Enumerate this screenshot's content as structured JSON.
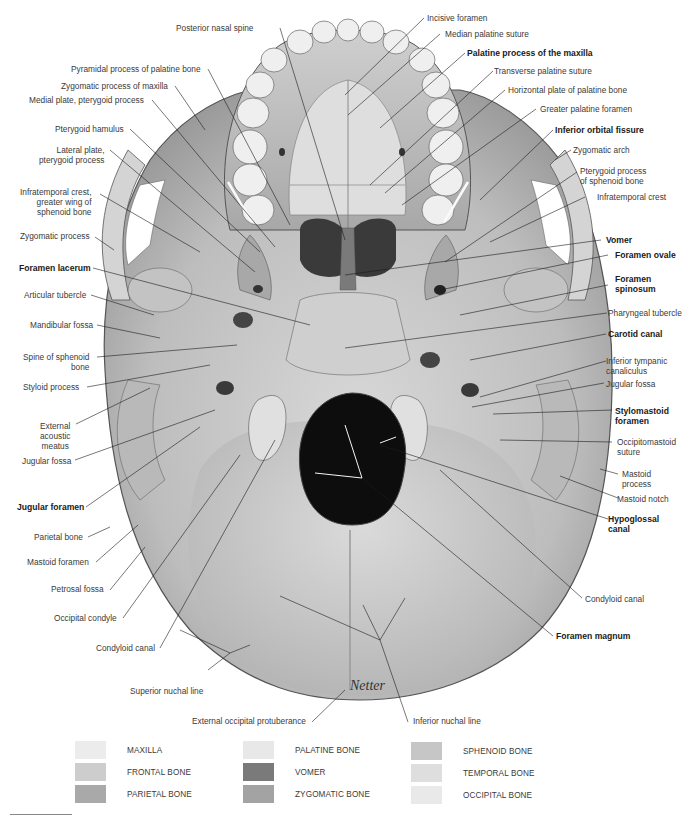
{
  "figure": {
    "signature": "Netter",
    "labels_left": [
      {
        "id": "posterior-nasal-spine",
        "text": "Posterior nasal spine",
        "bold": false
      },
      {
        "id": "pyramidal-process",
        "text": "Pyramidal process of palatine bone",
        "bold": false
      },
      {
        "id": "zygomatic-process-maxilla",
        "text": "Zygomatic process of maxilla",
        "bold": false
      },
      {
        "id": "medial-plate",
        "text": "Medial plate, pterygoid process",
        "bold": false
      },
      {
        "id": "pterygoid-hamulus",
        "text": "Pterygoid hamulus",
        "bold": false
      },
      {
        "id": "lateral-plate",
        "text": "Lateral plate,\npterygoid process",
        "bold": false
      },
      {
        "id": "infratemporal-crest-greater-wing",
        "text": "Infratemporal crest,\ngreater wing of\nsphenoid bone",
        "bold": false
      },
      {
        "id": "zygomatic-process",
        "text": "Zygomatic process",
        "bold": false
      },
      {
        "id": "foramen-lacerum",
        "text": "Foramen lacerum",
        "bold": true
      },
      {
        "id": "articular-tubercle",
        "text": "Articular tubercle",
        "bold": false
      },
      {
        "id": "mandibular-fossa",
        "text": "Mandibular fossa",
        "bold": false
      },
      {
        "id": "spine-of-sphenoid",
        "text": "Spine of sphenoid\nbone",
        "bold": false
      },
      {
        "id": "styloid-process",
        "text": "Styloid process",
        "bold": false
      },
      {
        "id": "external-acoustic-meatus",
        "text": "External\nacoustic\nmeatus",
        "bold": false
      },
      {
        "id": "jugular-fossa-left",
        "text": "Jugular fossa",
        "bold": false
      },
      {
        "id": "jugular-foramen",
        "text": "Jugular foramen",
        "bold": true
      },
      {
        "id": "parietal-bone",
        "text": "Parietal bone",
        "bold": false
      },
      {
        "id": "mastoid-foramen",
        "text": "Mastoid foramen",
        "bold": false
      },
      {
        "id": "petrosal-fossa",
        "text": "Petrosal fossa",
        "bold": false
      },
      {
        "id": "occipital-condyle",
        "text": "Occipital condyle",
        "bold": false
      },
      {
        "id": "condyloid-canal-left",
        "text": "Condyloid canal",
        "bold": false
      },
      {
        "id": "superior-nuchal-line",
        "text": "Superior nuchal line",
        "bold": false
      },
      {
        "id": "external-occipital-protuberance",
        "text": "External occipital protuberance",
        "bold": false
      }
    ],
    "labels_right": [
      {
        "id": "incisive-foramen",
        "text": "Incisive foramen",
        "bold": false
      },
      {
        "id": "median-palatine-suture",
        "text": "Median palatine suture",
        "bold": false
      },
      {
        "id": "palatine-process-maxilla",
        "text": "Palatine process of the maxilla",
        "bold": true
      },
      {
        "id": "transverse-palatine-suture",
        "text": "Transverse palatine suture",
        "bold": false
      },
      {
        "id": "horizontal-plate",
        "text": "Horizontal plate of palatine bone",
        "bold": false
      },
      {
        "id": "greater-palatine-foramen",
        "text": "Greater palatine foramen",
        "bold": false
      },
      {
        "id": "inferior-orbital-fissure",
        "text": "Inferior orbital fissure",
        "bold": true
      },
      {
        "id": "zygomatic-arch",
        "text": "Zygomatic arch",
        "bold": false
      },
      {
        "id": "pterygoid-process-sphenoid",
        "text": "Pterygoid process\nof sphenoid bone",
        "bold": false
      },
      {
        "id": "infratemporal-crest",
        "text": "Infratemporal crest",
        "bold": false
      },
      {
        "id": "vomer",
        "text": "Vomer",
        "bold": true
      },
      {
        "id": "foramen-ovale",
        "text": "Foramen ovale",
        "bold": true
      },
      {
        "id": "foramen-spinosum",
        "text": "Foramen\nspinosum",
        "bold": true
      },
      {
        "id": "pharyngeal-tubercle",
        "text": "Pharyngeal tubercle",
        "bold": false
      },
      {
        "id": "carotid-canal",
        "text": "Carotid canal",
        "bold": true
      },
      {
        "id": "inferior-tympanic-canaliculus",
        "text": "Inferior tympanic\ncanaliculus",
        "bold": false
      },
      {
        "id": "jugular-fossa-right",
        "text": "Jugular fossa",
        "bold": false
      },
      {
        "id": "stylomastoid-foramen",
        "text": "Stylomastoid\nforamen",
        "bold": true
      },
      {
        "id": "occipitomastoid-suture",
        "text": "Occipitomastoid\nsuture",
        "bold": false
      },
      {
        "id": "mastoid-process",
        "text": "Mastoid\nprocess",
        "bold": false
      },
      {
        "id": "mastoid-notch",
        "text": "Mastoid notch",
        "bold": false
      },
      {
        "id": "hypoglossal-canal",
        "text": "Hypoglossal\ncanal",
        "bold": true
      },
      {
        "id": "condyloid-canal-right",
        "text": "Condyloid canal",
        "bold": false
      },
      {
        "id": "foramen-magnum",
        "text": "Foramen magnum",
        "bold": true
      },
      {
        "id": "inferior-nuchal-line",
        "text": "Inferior nuchal line",
        "bold": false
      }
    ]
  },
  "legend": {
    "items": [
      {
        "label": "MAXILLA",
        "color": "#ececec"
      },
      {
        "label": "FRONTAL BONE",
        "color": "#cdcdcd"
      },
      {
        "label": "PARIETAL BONE",
        "color": "#a9a9a9"
      },
      {
        "label": "PALATINE BONE",
        "color": "#e8e8e8"
      },
      {
        "label": "VOMER",
        "color": "#7a7a7a"
      },
      {
        "label": "ZYGOMATIC BONE",
        "color": "#a3a3a3"
      },
      {
        "label": "SPHENOID BONE",
        "color": "#c6c6c6"
      },
      {
        "label": "TEMPORAL BONE",
        "color": "#dedede"
      },
      {
        "label": "OCCIPITAL BONE",
        "color": "#e9e9e9"
      }
    ]
  }
}
